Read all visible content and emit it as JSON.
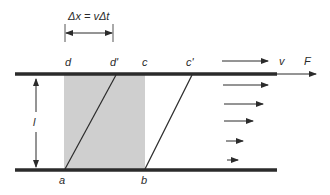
{
  "diagram": {
    "colors": {
      "background": "#ffffff",
      "plate": "#2b2b2b",
      "line": "#2b2b2b",
      "shaded_region": "#cfcfcf"
    },
    "displacement_label": "Δx = vΔt",
    "height_label": "l",
    "top_plate": {
      "velocity_label": "v",
      "force_label": "F"
    },
    "points": {
      "a": "a",
      "b": "b",
      "c": "c",
      "c_prime": "c'",
      "d": "d",
      "d_prime": "d'"
    },
    "velocity_profile_arrows": [
      {
        "y": 85,
        "x1": 223,
        "x2": 268
      },
      {
        "y": 104,
        "x1": 224,
        "x2": 263
      },
      {
        "y": 121,
        "x1": 224,
        "x2": 253
      },
      {
        "y": 141,
        "x1": 226,
        "x2": 243
      },
      {
        "y": 160,
        "x1": 227,
        "x2": 238
      }
    ]
  }
}
